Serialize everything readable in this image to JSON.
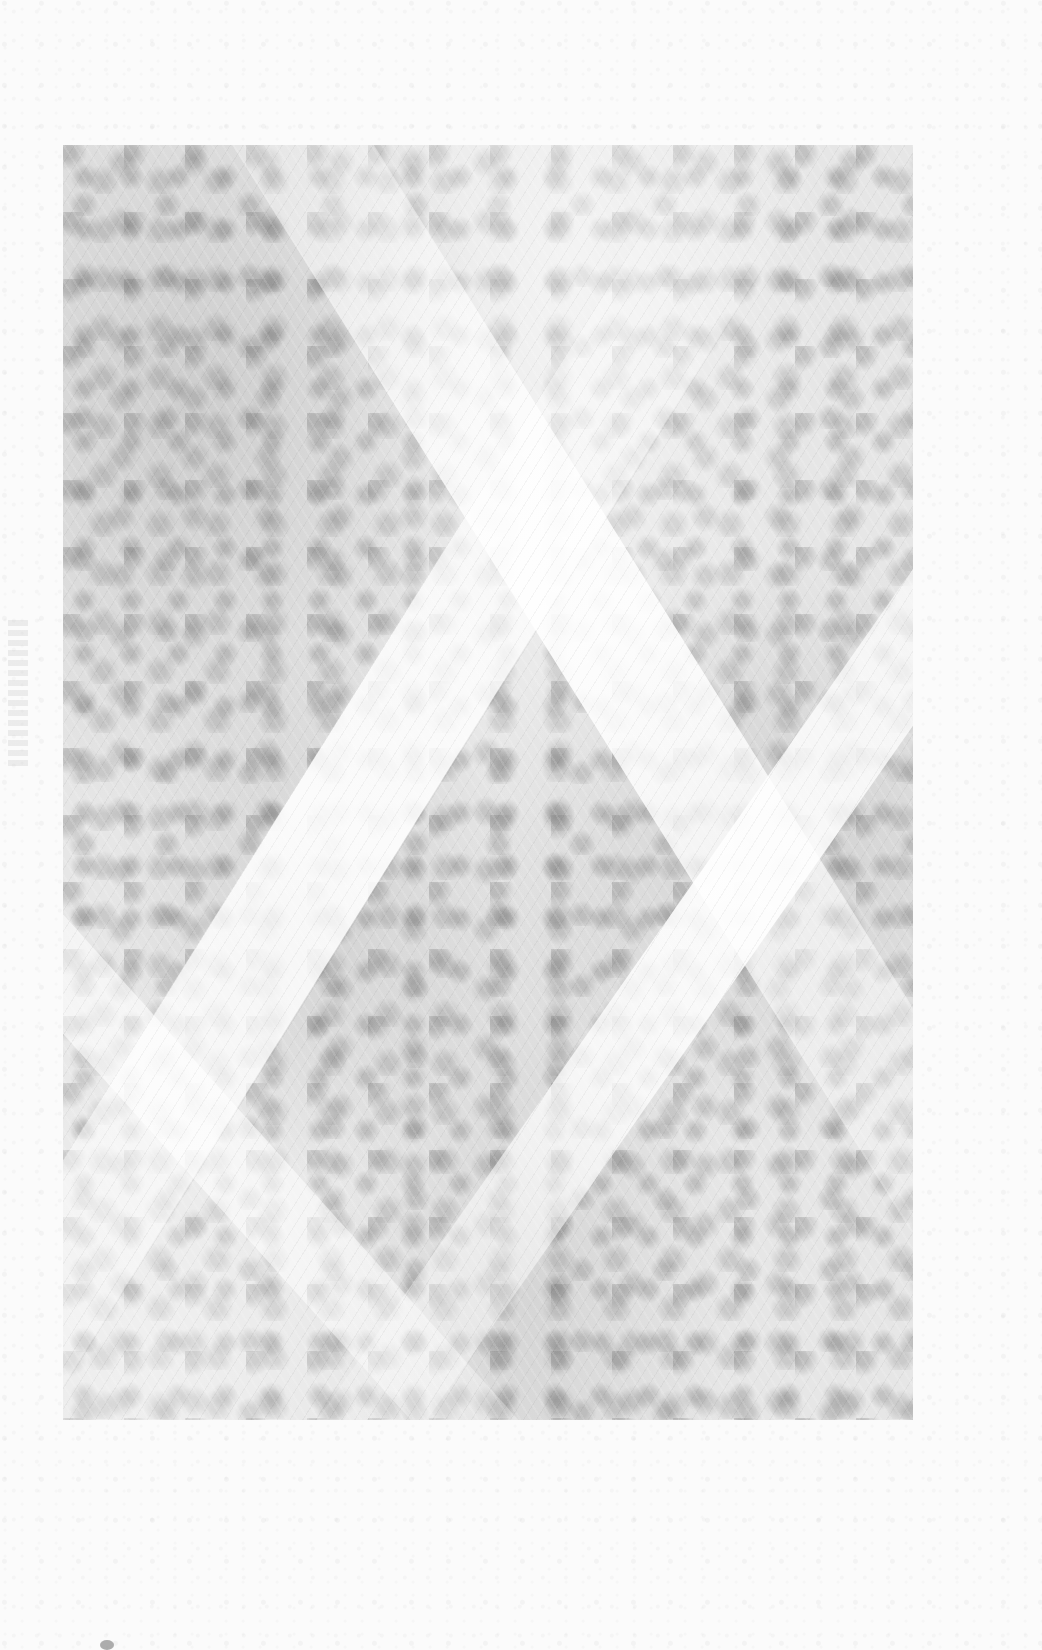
{
  "page": {
    "type": "scanned-page",
    "background_color": "#fbfbfb"
  },
  "figure": {
    "kind": "micrograph-texture",
    "tone_color": "#e6e6e6",
    "caption": ""
  }
}
